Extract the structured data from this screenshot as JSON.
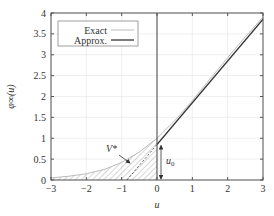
{
  "chart_data": {
    "type": "line",
    "title": "",
    "xlabel": "u",
    "ylabel": "φ∞(u)",
    "xlim": [
      -3,
      3
    ],
    "ylim": [
      0,
      4
    ],
    "xticks": [
      -3,
      -2,
      -1,
      0,
      1,
      2,
      3
    ],
    "yticks": [
      0,
      0.5,
      1,
      1.5,
      2,
      2.5,
      3,
      3.5,
      4
    ],
    "xtick_labels": [
      "−3",
      "−2",
      "−1",
      "0",
      "1",
      "2",
      "3"
    ],
    "ytick_labels": [
      "0",
      "0.5",
      "1",
      "1.5",
      "2",
      "2.5",
      "3",
      "3.5",
      "4"
    ],
    "grid": true,
    "legend": {
      "position": "top-left",
      "entries": [
        {
          "label": "Exact",
          "color": "#bbbbbb"
        },
        {
          "label": "Approx.",
          "color": "#333333"
        }
      ]
    },
    "series": [
      {
        "name": "Exact",
        "color": "#bbbbbb",
        "x": [
          -3,
          -2.5,
          -2,
          -1.5,
          -1,
          -0.5,
          0,
          0.5,
          1,
          1.5,
          2,
          2.5,
          3
        ],
        "y": [
          0.05,
          0.09,
          0.15,
          0.25,
          0.42,
          0.67,
          1.0,
          1.42,
          1.9,
          2.42,
          2.93,
          3.43,
          3.9
        ]
      },
      {
        "name": "Approx.",
        "color": "#333333",
        "x": [
          0,
          3
        ],
        "y": [
          0.85,
          3.85
        ]
      },
      {
        "name": "Approx. extension (dashed)",
        "color": "#333333",
        "style": "dashed",
        "x": [
          -0.85,
          0
        ],
        "y": [
          0,
          0.85
        ]
      }
    ],
    "annotations": [
      {
        "text": "V*",
        "type": "hatched-region",
        "description": "region between exact curve and zero for u<0"
      },
      {
        "text": "u0",
        "type": "double-arrow",
        "x": 0,
        "y_range": [
          0,
          0.85
        ]
      }
    ],
    "vertical_line": {
      "x": 0
    }
  }
}
